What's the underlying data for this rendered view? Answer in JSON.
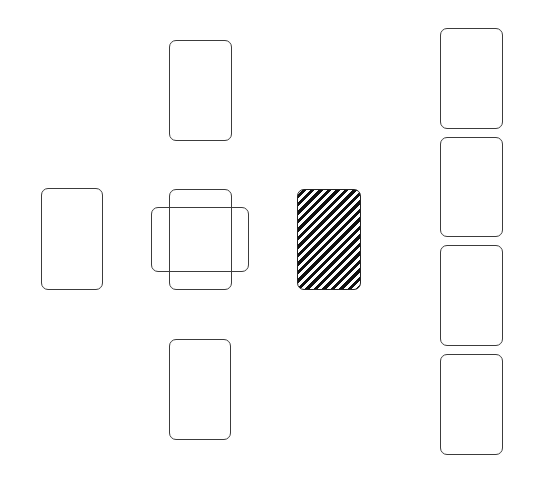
{
  "board": {
    "background": "#ffffff",
    "card_border_color": "#3c3c3c",
    "cards": [
      {
        "id": "north",
        "role": "foundation",
        "x": 169,
        "y": 40,
        "w": 63,
        "h": 101,
        "face": "empty"
      },
      {
        "id": "west",
        "role": "foundation",
        "x": 41,
        "y": 188,
        "w": 62,
        "h": 102,
        "face": "empty"
      },
      {
        "id": "center-vertical",
        "role": "center-slot",
        "x": 169,
        "y": 189,
        "w": 63,
        "h": 101,
        "face": "empty"
      },
      {
        "id": "center-horizontal",
        "role": "center-slot-crossed",
        "x": 151,
        "y": 207,
        "w": 98,
        "h": 65,
        "face": "empty"
      },
      {
        "id": "south",
        "role": "foundation",
        "x": 169,
        "y": 339,
        "w": 62,
        "h": 101,
        "face": "empty"
      },
      {
        "id": "stock",
        "role": "stock-pile",
        "x": 297,
        "y": 189,
        "w": 64,
        "h": 101,
        "face": "back-striped"
      },
      {
        "id": "column-1",
        "role": "reserve",
        "x": 440,
        "y": 28,
        "w": 63,
        "h": 101,
        "face": "empty"
      },
      {
        "id": "column-2",
        "role": "reserve",
        "x": 440,
        "y": 137,
        "w": 63,
        "h": 100,
        "face": "empty"
      },
      {
        "id": "column-3",
        "role": "reserve",
        "x": 440,
        "y": 245,
        "w": 63,
        "h": 101,
        "face": "empty"
      },
      {
        "id": "column-4",
        "role": "reserve",
        "x": 440,
        "y": 354,
        "w": 63,
        "h": 101,
        "face": "empty"
      }
    ]
  }
}
